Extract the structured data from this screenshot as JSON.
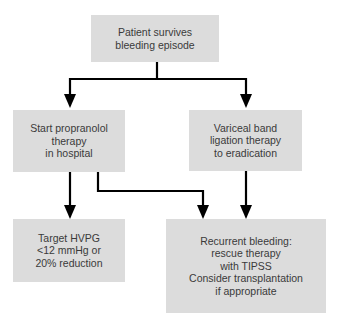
{
  "diagram": {
    "type": "flowchart",
    "nodes": [
      {
        "id": "start",
        "lines": [
          "Patient survives",
          "bleeding episode"
        ]
      },
      {
        "id": "propranolol",
        "lines": [
          "Start propranolol",
          "therapy",
          "in hospital"
        ]
      },
      {
        "id": "banding",
        "lines": [
          "Variceal band",
          "ligation therapy",
          "to eradication"
        ]
      },
      {
        "id": "target",
        "lines": [
          "Target HVPG",
          "<12 mmHg or",
          "20% reduction"
        ]
      },
      {
        "id": "rescue",
        "lines": [
          "Recurrent bleeding:",
          "rescue therapy",
          "with TIPSS",
          "Consider transplantation",
          "if appropriate"
        ]
      }
    ],
    "edges": [
      {
        "from": "start",
        "to": "propranolol"
      },
      {
        "from": "start",
        "to": "banding"
      },
      {
        "from": "propranolol",
        "to": "target"
      },
      {
        "from": "propranolol",
        "to": "rescue"
      },
      {
        "from": "banding",
        "to": "rescue"
      }
    ],
    "colors": {
      "box_fill": "#dcdcdc",
      "text": "#3a3a3a",
      "line": "#000000"
    }
  }
}
